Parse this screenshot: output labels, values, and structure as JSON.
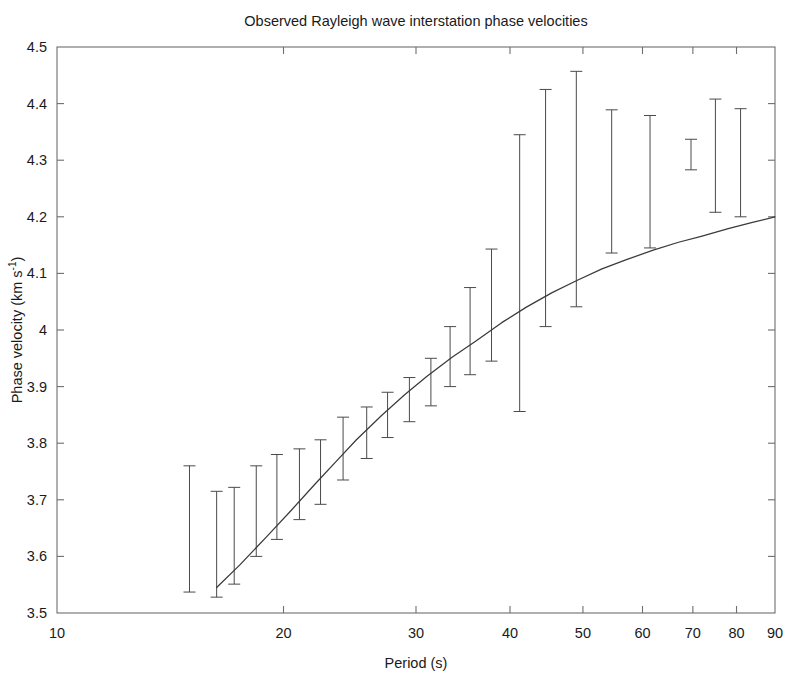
{
  "chart_data": {
    "type": "line",
    "title": "Observed Rayleigh wave interstation phase velocities",
    "xlabel": "Period (s)",
    "ylabel": "Phase velocity (km s⁻¹)",
    "ylabel_parts": {
      "main": "Phase velocity (km s",
      "exponent": "-1",
      "tail": ")"
    },
    "xscale": "log",
    "yscale": "linear",
    "xlim": [
      10,
      90
    ],
    "ylim": [
      3.5,
      4.5
    ],
    "grid": false,
    "legend": null,
    "xticks": [
      10,
      20,
      30,
      40,
      50,
      60,
      70,
      80,
      90
    ],
    "xtick_labels": [
      "10",
      "20",
      "30",
      "40",
      "50",
      "60",
      "70",
      "80",
      "90"
    ],
    "yticks": [
      3.5,
      3.6,
      3.7,
      3.8,
      3.9,
      4.0,
      4.1,
      4.2,
      4.3,
      4.4,
      4.5
    ],
    "ytick_labels": [
      "3.5",
      "3.6",
      "3.7",
      "3.8",
      "3.9",
      "4",
      "4.1",
      "4.2",
      "4.3",
      "4.4",
      "4.5"
    ],
    "series": [
      {
        "name": "model dispersion curve",
        "type": "line",
        "color": "#3a3a3a",
        "x": [
          16.3,
          17.5,
          19.0,
          20.5,
          22.0,
          23.5,
          25.0,
          27.0,
          29.0,
          31.0,
          33.5,
          36.0,
          39.0,
          42.0,
          45.5,
          49.0,
          53.0,
          57.0,
          62.0,
          67.0,
          72.0,
          78.0,
          84.0,
          90.0
        ],
        "y": [
          3.545,
          3.585,
          3.635,
          3.682,
          3.727,
          3.768,
          3.806,
          3.849,
          3.886,
          3.918,
          3.952,
          3.98,
          4.013,
          4.04,
          4.066,
          4.087,
          4.108,
          4.124,
          4.141,
          4.155,
          4.166,
          4.179,
          4.19,
          4.2
        ]
      },
      {
        "name": "observed phase velocities with uncertainty",
        "type": "errorbar",
        "color": "#4a4a4a",
        "points": [
          {
            "period": 15.0,
            "low": 3.537,
            "high": 3.76
          },
          {
            "period": 16.3,
            "low": 3.528,
            "high": 3.715
          },
          {
            "period": 17.2,
            "low": 3.551,
            "high": 3.722
          },
          {
            "period": 18.4,
            "low": 3.6,
            "high": 3.76
          },
          {
            "period": 19.6,
            "low": 3.63,
            "high": 3.78
          },
          {
            "period": 21.0,
            "low": 3.665,
            "high": 3.79
          },
          {
            "period": 22.4,
            "low": 3.692,
            "high": 3.806
          },
          {
            "period": 24.0,
            "low": 3.735,
            "high": 3.846
          },
          {
            "period": 25.8,
            "low": 3.773,
            "high": 3.864
          },
          {
            "period": 27.5,
            "low": 3.81,
            "high": 3.89
          },
          {
            "period": 29.4,
            "low": 3.838,
            "high": 3.916
          },
          {
            "period": 31.4,
            "low": 3.866,
            "high": 3.95
          },
          {
            "period": 33.3,
            "low": 3.9,
            "high": 4.006
          },
          {
            "period": 35.4,
            "low": 3.921,
            "high": 4.075
          },
          {
            "period": 37.8,
            "low": 3.945,
            "high": 4.143
          },
          {
            "period": 41.2,
            "low": 3.856,
            "high": 4.345
          },
          {
            "period": 44.6,
            "low": 4.006,
            "high": 4.425
          },
          {
            "period": 49.0,
            "low": 4.041,
            "high": 4.457
          },
          {
            "period": 54.6,
            "low": 4.136,
            "high": 4.389
          },
          {
            "period": 61.4,
            "low": 4.145,
            "high": 4.379
          },
          {
            "period": 69.6,
            "low": 4.283,
            "high": 4.337
          },
          {
            "period": 75.0,
            "low": 4.208,
            "high": 4.408
          },
          {
            "period": 81.0,
            "low": 4.2,
            "high": 4.391
          }
        ]
      }
    ]
  }
}
